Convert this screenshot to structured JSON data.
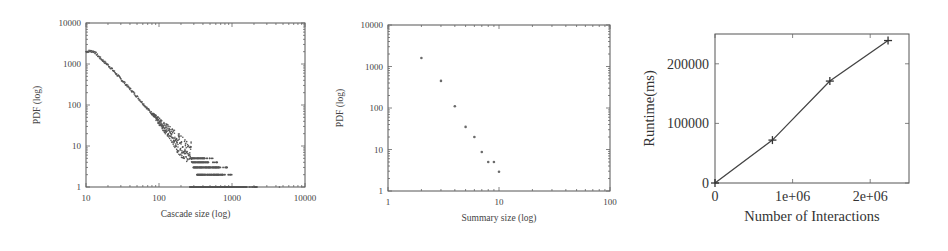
{
  "chart_data": [
    {
      "type": "scatter",
      "title": "",
      "xlabel": "Cascade size (log)",
      "ylabel": "PDF (log)",
      "xscale": "log",
      "yscale": "log",
      "xlim": [
        10,
        10000
      ],
      "ylim": [
        1,
        10000
      ],
      "x_ticks": [
        "10",
        "100",
        "1000",
        "10000"
      ],
      "y_ticks": [
        "1",
        "10",
        "100",
        "1000",
        "10000"
      ],
      "grid": false,
      "legend": null,
      "description": "Power-law distribution: plateau ~2000 for sizes 10-13, then decays roughly as size^-2; scatter widens beyond ~150, discrete bands at PDF=1..5 for sizes 250-2000, sparse tail at PDF=1 up to ~5000",
      "series": [
        {
          "name": "cascade size distribution",
          "x": [
            10,
            11,
            12,
            13,
            15,
            18,
            20,
            25,
            30,
            40,
            50,
            60,
            70,
            80,
            100,
            120,
            150,
            180,
            200,
            250,
            300,
            400,
            500,
            700,
            1000,
            1500,
            2000,
            3000,
            5000
          ],
          "y": [
            2000,
            2050,
            2050,
            2000,
            1500,
            1100,
            950,
            620,
            430,
            250,
            160,
            110,
            80,
            62,
            40,
            28,
            18,
            12,
            10,
            7,
            5,
            4,
            3,
            2,
            1,
            1,
            1,
            1,
            1
          ]
        }
      ]
    },
    {
      "type": "scatter",
      "title": "",
      "xlabel": "Summary size (log)",
      "ylabel": "PDF (log)",
      "xscale": "log",
      "yscale": "log",
      "xlim": [
        1,
        100
      ],
      "ylim": [
        1,
        10000
      ],
      "x_ticks": [
        "1",
        "10",
        "100"
      ],
      "y_ticks": [
        "1",
        "10",
        "100",
        "1000",
        "10000"
      ],
      "grid": false,
      "legend": null,
      "series": [
        {
          "name": "summary size distribution",
          "x": [
            2,
            3,
            4,
            5,
            6,
            7,
            8,
            9,
            10
          ],
          "y": [
            1600,
            450,
            110,
            35,
            20,
            8.7,
            5,
            5,
            2.9
          ]
        }
      ]
    },
    {
      "type": "line",
      "title": "",
      "xlabel": "Number of Interactions",
      "ylabel": "Runtime(ms)",
      "xscale": "linear",
      "yscale": "linear",
      "xlim": [
        0,
        2500000
      ],
      "ylim": [
        0,
        250000
      ],
      "x_ticks": [
        "0",
        "1e+06",
        "2e+06"
      ],
      "y_ticks": [
        "0",
        "100000",
        "200000"
      ],
      "grid": false,
      "legend": null,
      "marker": "plus",
      "series": [
        {
          "name": "runtime",
          "x": [
            0,
            740000,
            1480000,
            2230000
          ],
          "y": [
            0,
            72000,
            171000,
            239000
          ]
        }
      ]
    }
  ]
}
